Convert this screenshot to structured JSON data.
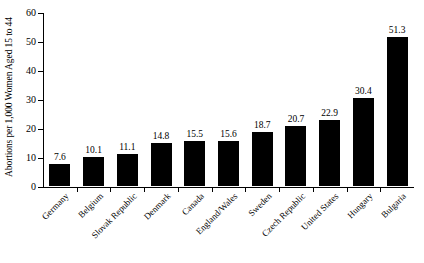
{
  "chart_data": {
    "type": "bar",
    "title": "",
    "xlabel": "",
    "ylabel": "Abortions per 1,000 Women Aged 15 to 44",
    "ylim": [
      0,
      60
    ],
    "yticks": [
      0,
      10,
      20,
      30,
      40,
      50,
      60
    ],
    "grid": false,
    "legend": null,
    "bar_color": "#000000",
    "categories": [
      "Germany",
      "Belgium",
      "Slovak Republic",
      "Denmark",
      "Canada",
      "England/Wales",
      "Sweden",
      "Czech Republic",
      "United States",
      "Hungary",
      "Bulgaria"
    ],
    "values": [
      7.6,
      10.1,
      11.1,
      14.8,
      15.5,
      15.6,
      18.7,
      20.7,
      22.9,
      30.4,
      51.3
    ],
    "value_labels": [
      "7.6",
      "10.1",
      "11.1",
      "14.8",
      "15.5",
      "15.6",
      "18.7",
      "20.7",
      "22.9",
      "30.4",
      "51.3"
    ],
    "ytick_labels": [
      "0",
      "10",
      "20",
      "30",
      "40",
      "50",
      "60"
    ]
  }
}
